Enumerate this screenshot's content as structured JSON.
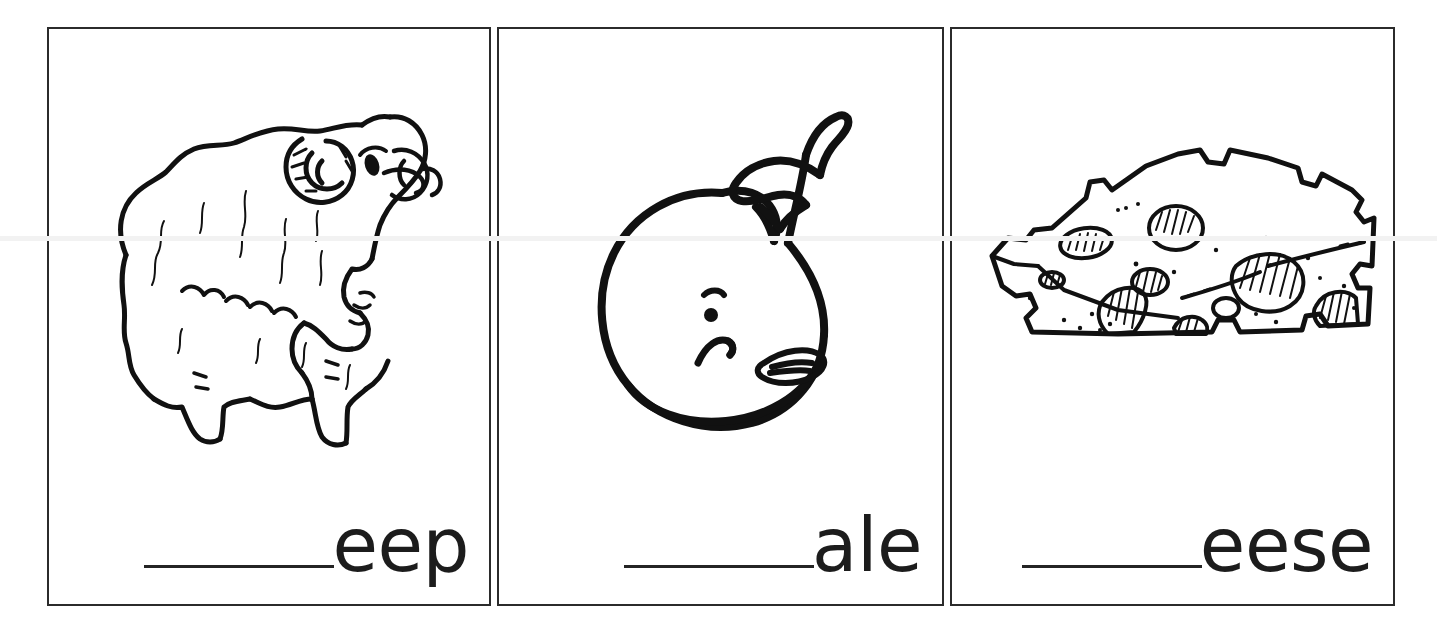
{
  "worksheet": {
    "type": "phonics-digraph-fill-in-the-blank",
    "background_color": "#ffffff",
    "ink_color": "#111111",
    "border_color": "#2b2b2b",
    "panel_count": 3
  },
  "panels": [
    {
      "id": "panel-sheep",
      "picture_name": "sheep-illustration",
      "picture_alt": "Line drawing of a woolly ram with curled horns, head lowered, facing right",
      "blank": "_______",
      "word_ending": "eep",
      "full_label": "_______eep"
    },
    {
      "id": "panel-whale",
      "picture_name": "whale-illustration",
      "picture_alt": "Cartoon line drawing of a smiling whale with raised tail flukes and a side flipper",
      "blank": "_______",
      "word_ending": "ale",
      "full_label": "_______ale"
    },
    {
      "id": "panel-cheese",
      "picture_name": "cheese-illustration",
      "picture_alt": "Line drawing of a wedge of Swiss cheese with round holes and speckles",
      "blank": "_______",
      "word_ending": "eese",
      "full_label": "_______eese"
    }
  ]
}
